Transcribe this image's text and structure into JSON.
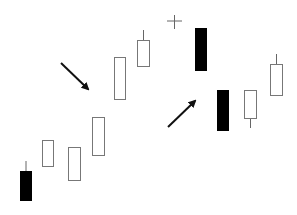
{
  "chart_data": {
    "type": "candlestick",
    "title": "",
    "xlabel": "",
    "ylabel": "",
    "grid": false,
    "legend": null,
    "note": "Candlestick pattern illustration: uptrend, doji/star, then bearish gap down followed by recovery. No axes or labels shown. Values are pixel-space (y down).",
    "colors": {
      "bullish_fill": "#ffffff",
      "bullish_stroke": "#777777",
      "bearish_fill": "#000000",
      "wick": "#666666",
      "arrow": "#111111"
    },
    "candles": [
      {
        "x": 20,
        "w": 12,
        "open": 171,
        "close": 201,
        "high": 161,
        "low": 201,
        "type": "bearish"
      },
      {
        "x": 42,
        "w": 12,
        "open": 167,
        "close": 140,
        "high": 140,
        "low": 167,
        "type": "bullish"
      },
      {
        "x": 68,
        "w": 13,
        "open": 181,
        "close": 147,
        "high": 147,
        "low": 181,
        "type": "bullish"
      },
      {
        "x": 92,
        "w": 13,
        "open": 156,
        "close": 117,
        "high": 117,
        "low": 156,
        "type": "bullish"
      },
      {
        "x": 114,
        "w": 12,
        "open": 100,
        "close": 57,
        "high": 57,
        "low": 100,
        "type": "bullish"
      },
      {
        "x": 137,
        "w": 13,
        "open": 67,
        "close": 40,
        "high": 30,
        "low": 67,
        "type": "bullish"
      },
      {
        "x": 167,
        "w": 15,
        "open": 21,
        "close": 21,
        "high": 15,
        "low": 29,
        "type": "doji"
      },
      {
        "x": 195,
        "w": 12,
        "open": 28,
        "close": 71,
        "high": 28,
        "low": 71,
        "type": "bearish"
      },
      {
        "x": 217,
        "w": 12,
        "open": 90,
        "close": 131,
        "high": 90,
        "low": 131,
        "type": "bearish"
      },
      {
        "x": 244,
        "w": 13,
        "open": 119,
        "close": 90,
        "high": 90,
        "low": 128,
        "type": "bullish"
      },
      {
        "x": 270,
        "w": 13,
        "open": 96,
        "close": 64,
        "high": 54,
        "low": 96,
        "type": "bullish"
      }
    ],
    "annotations": [
      {
        "type": "arrow",
        "direction": "down-right",
        "from": [
          61,
          63
        ],
        "to": [
          88,
          89
        ]
      },
      {
        "type": "arrow",
        "direction": "up-right",
        "from": [
          168,
          127
        ],
        "to": [
          195,
          101
        ]
      }
    ]
  }
}
